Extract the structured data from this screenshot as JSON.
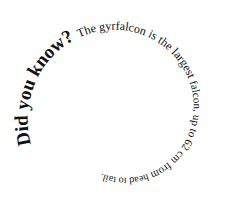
{
  "spiral": {
    "segments": [
      {
        "text": "Did you know? ",
        "size": 19,
        "weight": "bold"
      },
      {
        "text": "The gyrfalcon is the largest ",
        "size": 12,
        "weight": "normal"
      },
      {
        "text": "falcon, up to 62 cm from ",
        "size": 11,
        "weight": "normal"
      },
      {
        "text": "head to tail.",
        "size": 10,
        "weight": "normal"
      }
    ],
    "full_text": "Did you know? The gyrfalcon is the largest falcon, up to 62 cm from head to tail.",
    "color": "#111111"
  }
}
